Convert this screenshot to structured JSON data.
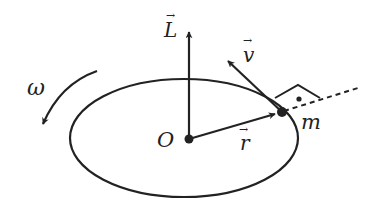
{
  "diagram": {
    "title": "",
    "labels": {
      "angular_momentum": "L",
      "velocity": "v",
      "position": "r",
      "origin": "O",
      "mass": "m",
      "angular_velocity": "ω"
    },
    "vector_marker": "→",
    "colors": {
      "stroke": "#222222",
      "background": "#ffffff"
    },
    "elements": [
      {
        "type": "ellipse",
        "name": "circular-orbit"
      },
      {
        "type": "arrow",
        "name": "angular-momentum-vector",
        "label": "L"
      },
      {
        "type": "arrow",
        "name": "velocity-vector",
        "label": "v"
      },
      {
        "type": "arrow",
        "name": "position-vector",
        "label": "r"
      },
      {
        "type": "point",
        "name": "origin",
        "label": "O"
      },
      {
        "type": "point",
        "name": "mass",
        "label": "m"
      },
      {
        "type": "curved-arrow",
        "name": "rotation-arrow",
        "label": "ω"
      },
      {
        "type": "right-angle-marker",
        "name": "right-angle"
      },
      {
        "type": "dashed-line",
        "name": "radial-extension"
      }
    ]
  }
}
